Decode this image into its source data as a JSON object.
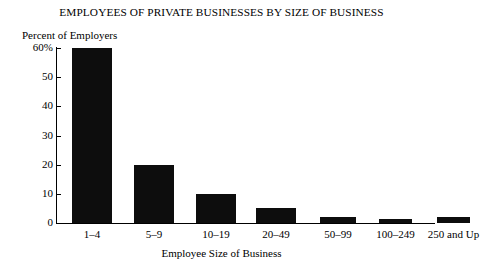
{
  "chart_data": {
    "type": "bar",
    "title": "EMPLOYEES OF PRIVATE BUSINESSES BY SIZE OF BUSINESS",
    "xlabel": "Employee Size of Business",
    "ylabel": "Percent of Employers",
    "categories": [
      "1–4",
      "5–9",
      "10–19",
      "20–49",
      "50–99",
      "100–249",
      "250 and Up"
    ],
    "values": [
      60,
      20,
      10,
      5,
      2,
      1.5,
      2
    ],
    "ylim": [
      0,
      60
    ],
    "yticks": [
      0,
      10,
      20,
      30,
      40,
      50,
      60
    ],
    "ytick_labels": [
      "0",
      "10",
      "20",
      "30",
      "40",
      "50",
      "60%"
    ],
    "grid": false,
    "legend": null,
    "bar_color": "#0d0d0d",
    "background_color": "#ffffff"
  }
}
